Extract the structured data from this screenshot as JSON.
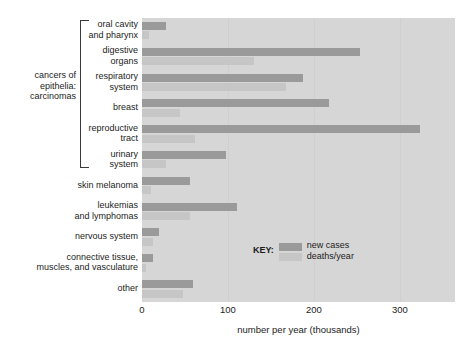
{
  "chart_data": {
    "type": "bar",
    "orientation": "horizontal",
    "title": "",
    "xlabel": "number per year (thousands)",
    "ylabel": "",
    "xlim": [
      0,
      364
    ],
    "xticks": [
      0,
      100,
      200,
      300
    ],
    "xtick_labels": [
      "0",
      "100",
      "200",
      "300"
    ],
    "grid": true,
    "legend_position": "inside-center-right",
    "legend_title": "KEY:",
    "categories": [
      "oral cavity and pharynx",
      "digestive organs",
      "respiratory system",
      "breast",
      "reproductive tract",
      "urinary system",
      "skin melanoma",
      "leukemias and lymphomas",
      "nervous system",
      "connective tissue, muscles, and vasculature",
      "other"
    ],
    "category_lines": [
      [
        "oral cavity",
        "and pharynx"
      ],
      [
        "digestive",
        "organs"
      ],
      [
        "respiratory",
        "system"
      ],
      [
        "breast"
      ],
      [
        "reproductive",
        "tract"
      ],
      [
        "urinary",
        "system"
      ],
      [
        "skin melanoma"
      ],
      [
        "leukemias",
        "and lymphomas"
      ],
      [
        "nervous system"
      ],
      [
        "connective tissue,",
        "muscles, and vasculature"
      ],
      [
        "other"
      ]
    ],
    "series": [
      {
        "name": "new cases",
        "color": "#9a9a9a",
        "values": [
          28,
          253,
          187,
          217,
          323,
          98,
          56,
          111,
          20,
          13,
          59
        ]
      },
      {
        "name": "deaths/year",
        "color": "#c6c6c6",
        "values": [
          8,
          130,
          167,
          44,
          62,
          28,
          10,
          56,
          13,
          5,
          48
        ]
      }
    ],
    "group_bracket": {
      "label_lines": [
        "cancers of",
        "epithelia:",
        "carcinomas"
      ],
      "covers": [
        "oral cavity and pharynx",
        "digestive organs",
        "respiratory system",
        "breast",
        "reproductive tract",
        "urinary system"
      ]
    },
    "colors": {
      "panel_background": "#d6d6d6",
      "gridline": "#cfcfcf",
      "new_cases": "#9a9a9a",
      "deaths_per_year": "#c6c6c6",
      "text": "#1c1c1c"
    }
  }
}
